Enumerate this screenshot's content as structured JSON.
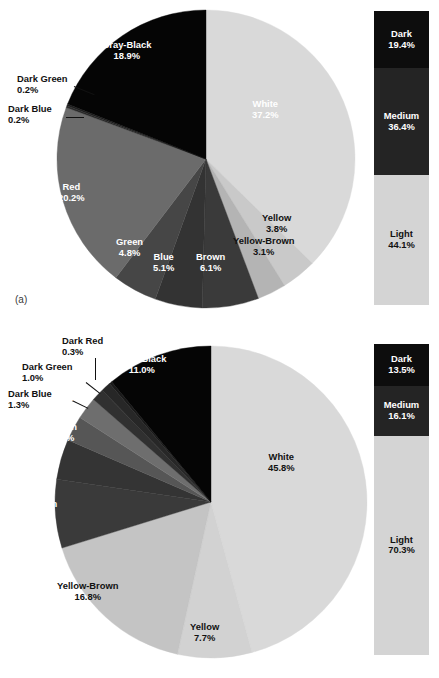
{
  "figure": {
    "panels": [
      {
        "id": "a",
        "caption": "(a)"
      },
      {
        "id": "b",
        "caption": "(b)"
      }
    ]
  },
  "chart_data": [
    {
      "type": "pie",
      "id": "pie-a",
      "title": "",
      "panel": "(a)",
      "unit": "%",
      "categories": [
        "White",
        "Yellow",
        "Yellow-Brown",
        "Brown",
        "Blue",
        "Green",
        "Red",
        "Dark Blue",
        "Dark Green",
        "Gray-Black"
      ],
      "values": [
        37.2,
        3.8,
        3.1,
        6.1,
        5.1,
        4.8,
        20.2,
        0.2,
        0.2,
        18.9
      ],
      "labels": [
        {
          "name": "White",
          "pct": "37.2%",
          "value": 37.2,
          "color": "#d9d9d9",
          "text": "dark"
        },
        {
          "name": "Yellow",
          "pct": "3.8%",
          "value": 3.8,
          "color": "#c9c9c9",
          "text": "dark"
        },
        {
          "name": "Yellow-Brown",
          "pct": "3.1%",
          "value": 3.1,
          "color": "#b4b4b4",
          "text": "dark"
        },
        {
          "name": "Brown",
          "pct": "6.1%",
          "value": 6.1,
          "color": "#3a3a3a",
          "text": "light"
        },
        {
          "name": "Blue",
          "pct": "5.1%",
          "value": 5.1,
          "color": "#333333",
          "text": "light"
        },
        {
          "name": "Green",
          "pct": "4.8%",
          "value": 4.8,
          "color": "#464646",
          "text": "light"
        },
        {
          "name": "Red",
          "pct": "20.2%",
          "value": 20.2,
          "color": "#6b6b6b",
          "text": "light"
        },
        {
          "name": "Dark Blue",
          "pct": "0.2%",
          "value": 0.2,
          "color": "#2a2a2a",
          "text": "dark"
        },
        {
          "name": "Dark Green",
          "pct": "0.2%",
          "value": 0.2,
          "color": "#1f1f1f",
          "text": "dark"
        },
        {
          "name": "Gray-Black",
          "pct": "18.9%",
          "value": 18.9,
          "color": "#050505",
          "text": "light"
        }
      ],
      "legend_position": "right",
      "legend": {
        "segments": [
          {
            "name": "Dark",
            "pct": "19.4%",
            "value": 19.4,
            "color": "#0d0d0d"
          },
          {
            "name": "Medium",
            "pct": "36.4%",
            "value": 36.4,
            "color": "#242424"
          },
          {
            "name": "Light",
            "pct": "44.1%",
            "value": 44.1,
            "color": "#d4d4d4"
          }
        ]
      }
    },
    {
      "type": "pie",
      "id": "pie-b",
      "title": "",
      "panel": "(b)",
      "unit": "%",
      "categories": [
        "White",
        "Yellow",
        "Yellow-Brown",
        "Brown",
        "Blue",
        "Green",
        "Red",
        "Dark Blue",
        "Dark Green",
        "Dark Red",
        "Gray-Black"
      ],
      "values": [
        45.8,
        7.7,
        16.8,
        7.1,
        4.2,
        2.6,
        2.3,
        1.3,
        1.0,
        0.3,
        11.0
      ],
      "labels": [
        {
          "name": "White",
          "pct": "45.8%",
          "value": 45.8,
          "color": "#d9d9d9",
          "text": "dark"
        },
        {
          "name": "Yellow",
          "pct": "7.7%",
          "value": 7.7,
          "color": "#d2d2d2",
          "text": "dark"
        },
        {
          "name": "Yellow-Brown",
          "pct": "16.8%",
          "value": 16.8,
          "color": "#c4c4c4",
          "text": "dark"
        },
        {
          "name": "Brown",
          "pct": "7.1%",
          "value": 7.1,
          "color": "#3a3a3a",
          "text": "light"
        },
        {
          "name": "Blue",
          "pct": "4.2%",
          "value": 4.2,
          "color": "#343434",
          "text": "light"
        },
        {
          "name": "Green",
          "pct": "2.6%",
          "value": 2.6,
          "color": "#565656",
          "text": "light"
        },
        {
          "name": "Red",
          "pct": "2.3%",
          "value": 2.3,
          "color": "#6e6e6e",
          "text": "light"
        },
        {
          "name": "Dark Blue",
          "pct": "1.3%",
          "value": 1.3,
          "color": "#303030",
          "text": "dark"
        },
        {
          "name": "Dark Green",
          "pct": "1.0%",
          "value": 1.0,
          "color": "#272727",
          "text": "dark"
        },
        {
          "name": "Dark Red",
          "pct": "0.3%",
          "value": 0.3,
          "color": "#1a1a1a",
          "text": "dark"
        },
        {
          "name": "Gray-Black",
          "pct": "11.0%",
          "value": 11.0,
          "color": "#050505",
          "text": "light"
        }
      ],
      "legend_position": "right",
      "legend": {
        "segments": [
          {
            "name": "Dark",
            "pct": "13.5%",
            "value": 13.5,
            "color": "#0d0d0d"
          },
          {
            "name": "Medium",
            "pct": "16.1%",
            "value": 16.1,
            "color": "#242424"
          },
          {
            "name": "Light",
            "pct": "70.3%",
            "value": 70.3,
            "color": "#d4d4d4"
          }
        ]
      }
    }
  ]
}
